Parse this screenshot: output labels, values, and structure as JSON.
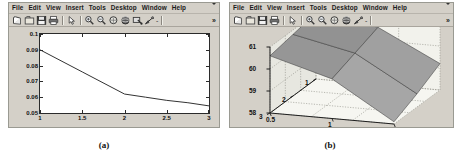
{
  "figure_a": {
    "window": {
      "menu": [
        "File",
        "Edit",
        "View",
        "Insert",
        "Tools",
        "Desktop",
        "Window",
        "Help"
      ],
      "menu_overflow": "▾",
      "toolbar_overflow": "»",
      "toolbar_icons": [
        "new-figure-icon",
        "open-file-icon",
        "save-figure-icon",
        "print-figure-icon",
        "edit-plot-icon",
        "zoom-in-icon",
        "zoom-out-icon",
        "pan-icon",
        "rotate-3d-icon",
        "data-cursor-icon",
        "insert-colorbar-icon"
      ],
      "toolbar_dash": "-"
    },
    "caption": "(a)"
  },
  "figure_b": {
    "window": {
      "menu": [
        "File",
        "Edit",
        "View",
        "Insert",
        "Tools",
        "Desktop",
        "Window",
        "Help"
      ],
      "menu_overflow": "▾",
      "toolbar_overflow": "»",
      "toolbar_icons": [
        "new-figure-icon",
        "open-file-icon",
        "save-figure-icon",
        "print-figure-icon",
        "edit-plot-icon",
        "zoom-in-icon",
        "zoom-out-icon",
        "pan-icon",
        "rotate-3d-icon",
        "insert-colorbar-icon"
      ],
      "toolbar_dash": "-"
    },
    "caption": "(b)"
  },
  "chart_data": [
    {
      "id": "plot-a",
      "type": "line",
      "title": "",
      "xlabel": "",
      "ylabel": "",
      "xlim": [
        1,
        3
      ],
      "ylim": [
        0.05,
        0.1
      ],
      "xticks": [
        "1",
        "1.5",
        "2",
        "2.5",
        "3"
      ],
      "xtick_values": [
        1,
        1.5,
        2,
        2.5,
        3
      ],
      "yticks": [
        "0.05",
        "0.06",
        "0.07",
        "0.08",
        "0.09",
        "0.1"
      ],
      "ytick_values": [
        0.05,
        0.06,
        0.07,
        0.08,
        0.09,
        0.1
      ],
      "grid": false,
      "legend": null,
      "series": [
        {
          "name": "error",
          "color": "#333333",
          "x": [
            1,
            1.5,
            2,
            2.25,
            2.5,
            2.75,
            3
          ],
          "y": [
            0.09,
            0.076,
            0.062,
            0.06,
            0.058,
            0.0565,
            0.0545
          ]
        }
      ]
    },
    {
      "id": "plot-b",
      "type": "surface",
      "title": "",
      "xlabel": "",
      "ylabel": "",
      "zlabel": "",
      "xticks": [
        "0.5",
        "1",
        "1.5"
      ],
      "xtick_values": [
        0.5,
        1,
        1.5
      ],
      "yticks": [
        "1",
        "2",
        "3"
      ],
      "ytick_values": [
        1,
        2,
        3
      ],
      "zticks": [
        "58",
        "59",
        "60",
        "61"
      ],
      "ztick_values": [
        58,
        59,
        60,
        61
      ],
      "zlim": [
        58,
        61
      ],
      "grid": true,
      "legend": null,
      "surface_color": "#8c8c8c",
      "surface_edge_color": "#4a4a4a",
      "values": [
        [
          61.0,
          60.6,
          59.2
        ],
        [
          60.8,
          60.2,
          58.6
        ],
        [
          60.6,
          59.8,
          58.1
        ]
      ]
    }
  ]
}
